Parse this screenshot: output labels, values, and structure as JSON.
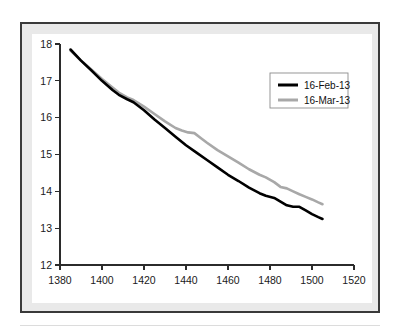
{
  "chart_data": {
    "type": "line",
    "title": "",
    "xlabel": "",
    "ylabel": "",
    "xlim": [
      1380,
      1520
    ],
    "ylim": [
      12,
      18
    ],
    "xticks": [
      1380,
      1400,
      1420,
      1440,
      1460,
      1480,
      1500,
      1520
    ],
    "xtick_labels": [
      "1380",
      "1400",
      "1420",
      "1440",
      "1460",
      "1480",
      "1500",
      "1520"
    ],
    "yticks": [
      12,
      13,
      14,
      15,
      16,
      17,
      18
    ],
    "ytick_labels": [
      "12",
      "13",
      "14",
      "15",
      "16",
      "17",
      "18"
    ],
    "grid": false,
    "legend_position": "upper right",
    "series": [
      {
        "name": "16-Feb-13",
        "color": "#000000",
        "linewidth": 2.6,
        "x": [
          1385,
          1390,
          1395,
          1400,
          1405,
          1408,
          1412,
          1415,
          1420,
          1425,
          1430,
          1435,
          1440,
          1445,
          1450,
          1455,
          1460,
          1465,
          1470,
          1475,
          1478,
          1482,
          1485,
          1488,
          1491,
          1494,
          1497,
          1500,
          1503,
          1505
        ],
        "y": [
          17.85,
          17.55,
          17.28,
          17.0,
          16.75,
          16.62,
          16.5,
          16.42,
          16.2,
          15.95,
          15.72,
          15.48,
          15.25,
          15.05,
          14.85,
          14.65,
          14.45,
          14.28,
          14.1,
          13.95,
          13.88,
          13.82,
          13.72,
          13.62,
          13.58,
          13.58,
          13.48,
          13.38,
          13.3,
          13.25
        ]
      },
      {
        "name": "16-Mar-13",
        "color": "#a8a8a8",
        "linewidth": 2.6,
        "x": [
          1385,
          1390,
          1395,
          1400,
          1405,
          1408,
          1412,
          1415,
          1420,
          1425,
          1430,
          1435,
          1438,
          1441,
          1444,
          1447,
          1450,
          1455,
          1460,
          1465,
          1470,
          1475,
          1478,
          1482,
          1485,
          1488,
          1491,
          1494,
          1497,
          1500,
          1503,
          1505
        ],
        "y": [
          17.82,
          17.55,
          17.3,
          17.05,
          16.82,
          16.68,
          16.55,
          16.48,
          16.3,
          16.1,
          15.9,
          15.72,
          15.65,
          15.6,
          15.58,
          15.45,
          15.32,
          15.12,
          14.95,
          14.78,
          14.6,
          14.45,
          14.38,
          14.25,
          14.12,
          14.08,
          14.0,
          13.92,
          13.85,
          13.78,
          13.7,
          13.65
        ]
      }
    ]
  },
  "legend": {
    "entries": [
      {
        "label": "16-Feb-13",
        "color": "#000000"
      },
      {
        "label": "16-Mar-13",
        "color": "#a8a8a8"
      }
    ]
  },
  "figure": {
    "frame_color": "#3a3a3a",
    "band_color": "#e9e9e9",
    "plot_background": "#ffffff",
    "axis_color": "#2b2b2b"
  }
}
